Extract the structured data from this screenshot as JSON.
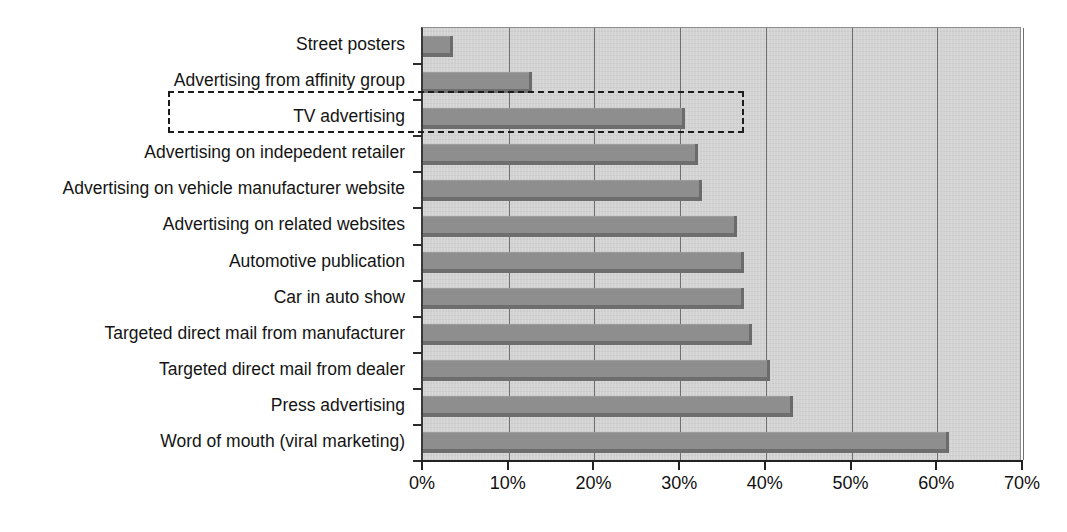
{
  "chart_data": {
    "type": "bar",
    "orientation": "horizontal",
    "title": "",
    "subtitle": "",
    "xlabel": "",
    "ylabel": "",
    "xlim": [
      0,
      70
    ],
    "ylim": null,
    "grid": "vertical",
    "legend": null,
    "xtick_labels": [
      "0%",
      "10%",
      "20%",
      "30%",
      "40%",
      "50%",
      "60%",
      "70%"
    ],
    "xtick_values": [
      0,
      10,
      20,
      30,
      40,
      50,
      60,
      70
    ],
    "categories": [
      "Street posters",
      "Advertising from affinity group",
      "TV advertising",
      "Advertising on indepedent retailer",
      "Advertising on vehicle manufacturer website",
      "Advertising on related websites",
      "Automotive publication",
      "Car in auto show",
      "Targeted direct mail from manufacturer",
      "Targeted direct mail from dealer",
      "Press advertising",
      "Word of mouth (viral marketing)"
    ],
    "values": [
      3.5,
      12.7,
      30.6,
      32.1,
      32.5,
      36.6,
      37.5,
      37.4,
      38.4,
      40.5,
      43.2,
      61.4
    ],
    "unit": "%",
    "annotations": [
      {
        "type": "dashed-highlight-box",
        "target_category": "TV advertising",
        "label": ""
      }
    ],
    "colors": {
      "bar_fill": "#8e8e8e",
      "bar_edge": "#6b6b6b",
      "plot_background": "#d2d2d2",
      "gridline": "#6f6f6f",
      "axis": "#222222",
      "text": "#141414",
      "highlight_outline": "#1c1c1c"
    }
  }
}
